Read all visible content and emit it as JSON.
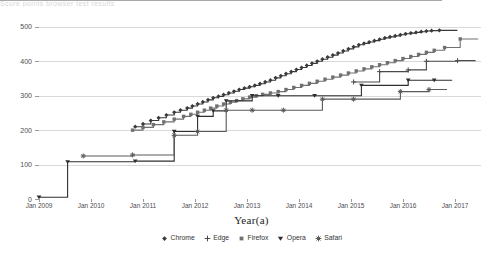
{
  "figure": {
    "header_strip_text": "Score points browser test results",
    "xtitle": "Year(a)",
    "ytitle": "Score (points)"
  },
  "chart_data": {
    "type": "line",
    "title": "",
    "subtitle": "",
    "xlabel": "Year(a)",
    "ylabel": "Score (points)",
    "xlim": [
      2009.0,
      2017.5
    ],
    "ylim": [
      0,
      520
    ],
    "yticks": [
      0,
      100,
      200,
      300,
      400,
      500
    ],
    "ytick_labels": [
      "0",
      "100",
      "200",
      "300",
      "400",
      "500"
    ],
    "xticks": [
      2009,
      2010,
      2011,
      2012,
      2013,
      2014,
      2015,
      2016,
      2017
    ],
    "xtick_labels": [
      "Jan 2009",
      "Jan 2010",
      "Jan 2011",
      "Jan 2012",
      "Jan 2013",
      "Jan 2014",
      "Jan 2015",
      "Jan 2016",
      "Jan 2017"
    ],
    "grid": true,
    "grid_axis": "y",
    "legend_position": "bottom",
    "drawstyle": "steps-post",
    "series": [
      {
        "name": "Chrome",
        "color": "#3a3a3a",
        "marker": "diamond",
        "x": [
          2010.85,
          2011.0,
          2011.15,
          2011.3,
          2011.45,
          2011.6,
          2011.72,
          2011.85,
          2011.95,
          2012.05,
          2012.15,
          2012.25,
          2012.35,
          2012.45,
          2012.55,
          2012.65,
          2012.75,
          2012.85,
          2012.95,
          2013.05,
          2013.15,
          2013.25,
          2013.35,
          2013.45,
          2013.55,
          2013.65,
          2013.75,
          2013.85,
          2013.95,
          2014.05,
          2014.15,
          2014.25,
          2014.35,
          2014.45,
          2014.55,
          2014.65,
          2014.75,
          2014.85,
          2014.95,
          2015.05,
          2015.15,
          2015.25,
          2015.35,
          2015.45,
          2015.55,
          2015.65,
          2015.75,
          2015.85,
          2015.95,
          2016.05,
          2016.15,
          2016.25,
          2016.35,
          2016.45,
          2016.55,
          2016.7
        ],
        "y": [
          210,
          218,
          228,
          236,
          244,
          252,
          258,
          264,
          270,
          276,
          282,
          288,
          294,
          298,
          303,
          308,
          313,
          318,
          322,
          326,
          330,
          335,
          340,
          345,
          352,
          358,
          364,
          370,
          376,
          382,
          388,
          394,
          400,
          406,
          412,
          418,
          424,
          430,
          436,
          442,
          448,
          452,
          456,
          460,
          464,
          468,
          471,
          474,
          477,
          480,
          482,
          484,
          486,
          488,
          489,
          490
        ]
      },
      {
        "name": "Edge",
        "color": "#4a4a4a",
        "marker": "cross",
        "x": [
          2015.05,
          2015.55,
          2016.1,
          2016.45,
          2017.05
        ],
        "y": [
          340,
          370,
          375,
          400,
          402
        ],
        "note": "lower sparse step series appearing after 2015"
      },
      {
        "name": "Firefox",
        "color": "#707070",
        "marker": "square",
        "x": [
          2010.8,
          2011.0,
          2011.2,
          2011.4,
          2011.6,
          2011.78,
          2011.92,
          2012.05,
          2012.18,
          2012.3,
          2012.42,
          2012.55,
          2012.68,
          2012.8,
          2012.92,
          2013.05,
          2013.18,
          2013.3,
          2013.45,
          2013.6,
          2013.75,
          2013.9,
          2014.05,
          2014.2,
          2014.35,
          2014.5,
          2014.65,
          2014.8,
          2014.95,
          2015.1,
          2015.25,
          2015.4,
          2015.55,
          2015.7,
          2015.85,
          2016.0,
          2016.15,
          2016.3,
          2016.45,
          2016.6,
          2016.8,
          2017.1
        ],
        "y": [
          200,
          208,
          216,
          224,
          232,
          240,
          246,
          252,
          258,
          264,
          270,
          276,
          281,
          286,
          291,
          296,
          300,
          304,
          308,
          312,
          318,
          324,
          330,
          336,
          342,
          348,
          354,
          360,
          366,
          372,
          378,
          384,
          390,
          396,
          402,
          408,
          414,
          420,
          426,
          432,
          440,
          465
        ]
      },
      {
        "name": "Opera",
        "color": "#2e2e2e",
        "marker": "triangle",
        "x": [
          2009.0,
          2009.55,
          2010.85,
          2011.6,
          2012.05,
          2012.35,
          2012.6,
          2013.1,
          2013.6,
          2014.3,
          2015.2,
          2016.1,
          2016.6
        ],
        "y": [
          5,
          108,
          110,
          196,
          240,
          256,
          285,
          300,
          300,
          300,
          330,
          345,
          345
        ]
      },
      {
        "name": "Safari",
        "color": "#5a5a5a",
        "marker": "star",
        "x": [
          2009.85,
          2010.8,
          2011.6,
          2012.05,
          2012.6,
          2013.1,
          2013.7,
          2014.45,
          2015.05,
          2015.95,
          2016.5
        ],
        "y": [
          125,
          128,
          185,
          196,
          258,
          258,
          258,
          290,
          290,
          312,
          318
        ]
      }
    ]
  },
  "legend": {
    "items": [
      {
        "label": "Chrome",
        "marker": "diamond",
        "color": "#3a3a3a"
      },
      {
        "label": "Edge",
        "marker": "cross",
        "color": "#4a4a4a"
      },
      {
        "label": "Firefox",
        "marker": "square",
        "color": "#707070"
      },
      {
        "label": "Opera",
        "marker": "triangle",
        "color": "#2e2e2e"
      },
      {
        "label": "Safari",
        "marker": "star",
        "color": "#5a5a5a"
      }
    ]
  }
}
